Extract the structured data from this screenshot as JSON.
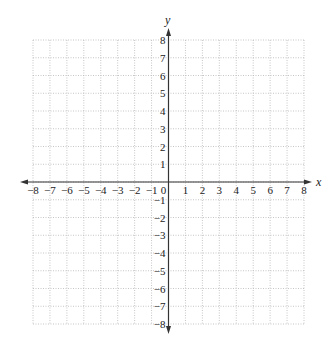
{
  "diagram": {
    "type": "coordinate-plane",
    "x_axis": {
      "label": "x",
      "min": -8,
      "max": 8,
      "step": 1,
      "tick_labels": [
        "−8",
        "−7",
        "−6",
        "−5",
        "−4",
        "−3",
        "−2",
        "−1",
        "0",
        "1",
        "2",
        "3",
        "4",
        "5",
        "6",
        "7",
        "8"
      ]
    },
    "y_axis": {
      "label": "y",
      "min": -8,
      "max": 8,
      "step": 1,
      "tick_labels_positive": [
        "1",
        "2",
        "3",
        "4",
        "5",
        "6",
        "7",
        "8"
      ],
      "tick_labels_negative": [
        "−1",
        "−2",
        "−3",
        "−4",
        "−5",
        "−6",
        "−7",
        "−8"
      ]
    },
    "origin_label": "0",
    "grid": {
      "style": "dotted",
      "color": "#b8b8b8"
    },
    "axis_color": "#333333"
  }
}
